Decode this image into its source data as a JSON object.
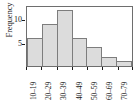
{
  "chart_data": {
    "type": "bar",
    "title": "",
    "subtitle": "",
    "xlabel": "",
    "ylabel": "Frequency",
    "categories": [
      "10–19",
      "20–29",
      "30–39",
      "40–49",
      "50–59",
      "60–69",
      "70–79"
    ],
    "values": [
      6,
      9,
      12,
      6,
      4,
      2,
      1
    ],
    "ylim": [
      0,
      13
    ],
    "yticks": [
      5,
      10
    ],
    "ytick_labels": [
      "5",
      "10"
    ],
    "grid": false,
    "legend": false,
    "bar_fill_color": "#dcdcdc",
    "bar_edge_color": "#7d7d7d",
    "frame_color": "#6e6e6e",
    "axis_text_color": "#1a1a1a",
    "background_color": "#ffffff"
  }
}
